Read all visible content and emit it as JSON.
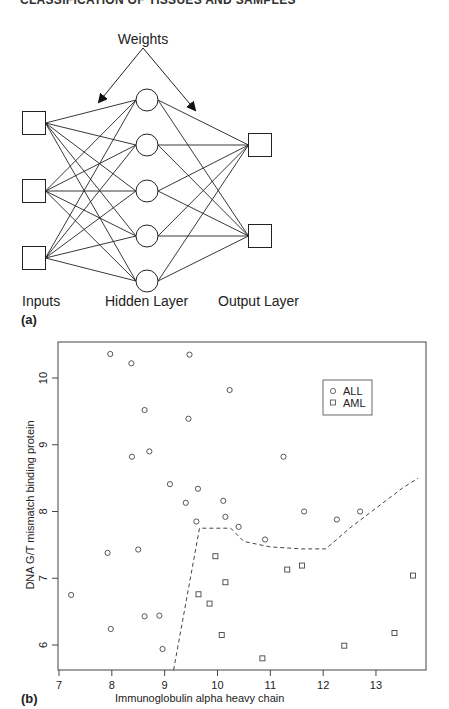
{
  "header": {
    "running_title": "CLASSIFICATION OF TISSUES AND SAMPLES"
  },
  "panel_a": {
    "label": "(a)",
    "weights_label": "Weights",
    "layer_labels": {
      "inputs": "Inputs",
      "hidden": "Hidden Layer",
      "output": "Output Layer"
    },
    "inputs": [
      {
        "cx": 34,
        "cy": 123
      },
      {
        "cx": 34,
        "cy": 191
      },
      {
        "cx": 34,
        "cy": 258
      }
    ],
    "hidden": [
      {
        "cx": 147,
        "cy": 100
      },
      {
        "cx": 147,
        "cy": 145
      },
      {
        "cx": 147,
        "cy": 191
      },
      {
        "cx": 147,
        "cy": 236
      },
      {
        "cx": 147,
        "cy": 281
      }
    ],
    "outputs": [
      {
        "cx": 260,
        "cy": 145
      },
      {
        "cx": 260,
        "cy": 236
      }
    ]
  },
  "panel_b": {
    "label": "(b)"
  },
  "chart_data": {
    "type": "scatter",
    "title": "",
    "xlabel": "Immunoglobulin alpha heavy chain",
    "ylabel": "DNA G/T mismatch binding protein",
    "xlim": [
      7,
      13.9
    ],
    "ylim": [
      5.6,
      10.5
    ],
    "x_ticks": [
      7,
      8,
      9,
      10,
      11,
      12,
      13
    ],
    "y_ticks": [
      6,
      7,
      8,
      9,
      10
    ],
    "grid": false,
    "legend": {
      "position": "upper right",
      "entries": [
        "ALL",
        "AML"
      ]
    },
    "series": [
      {
        "name": "ALL",
        "marker": "circle",
        "points": [
          [
            7.97,
            10.36
          ],
          [
            8.37,
            10.22
          ],
          [
            9.47,
            10.35
          ],
          [
            10.23,
            9.82
          ],
          [
            8.62,
            9.52
          ],
          [
            9.45,
            9.39
          ],
          [
            8.71,
            8.9
          ],
          [
            8.38,
            8.82
          ],
          [
            11.25,
            8.82
          ],
          [
            9.1,
            8.41
          ],
          [
            9.63,
            8.34
          ],
          [
            9.4,
            8.13
          ],
          [
            10.11,
            8.16
          ],
          [
            10.15,
            7.92
          ],
          [
            9.6,
            7.85
          ],
          [
            10.4,
            7.77
          ],
          [
            11.64,
            8.0
          ],
          [
            12.26,
            7.88
          ],
          [
            12.7,
            8.0
          ],
          [
            10.9,
            7.58
          ],
          [
            8.5,
            7.43
          ],
          [
            7.92,
            7.38
          ],
          [
            7.23,
            6.75
          ],
          [
            7.98,
            6.24
          ],
          [
            8.62,
            6.43
          ],
          [
            8.9,
            6.44
          ],
          [
            8.96,
            5.94
          ]
        ]
      },
      {
        "name": "AML",
        "marker": "square",
        "points": [
          [
            9.96,
            7.33
          ],
          [
            11.32,
            7.13
          ],
          [
            11.6,
            7.19
          ],
          [
            13.7,
            7.04
          ],
          [
            9.64,
            6.76
          ],
          [
            9.85,
            6.62
          ],
          [
            10.15,
            6.94
          ],
          [
            10.08,
            6.15
          ],
          [
            10.85,
            5.8
          ],
          [
            12.4,
            5.99
          ],
          [
            13.35,
            6.18
          ]
        ]
      }
    ],
    "decision_boundary": {
      "style": "dashed",
      "points": [
        [
          9.17,
          5.6
        ],
        [
          9.66,
          7.75
        ],
        [
          10.25,
          7.75
        ],
        [
          10.5,
          7.55
        ],
        [
          11.0,
          7.47
        ],
        [
          11.6,
          7.44
        ],
        [
          12.05,
          7.44
        ],
        [
          12.5,
          7.75
        ],
        [
          13.0,
          8.05
        ],
        [
          13.5,
          8.35
        ],
        [
          13.8,
          8.5
        ]
      ]
    }
  }
}
